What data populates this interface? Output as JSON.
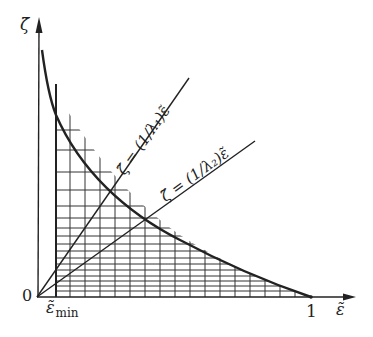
{
  "figure": {
    "axes": {
      "y_label": "ζ̃",
      "x_label": "ε̃",
      "origin_label": "0",
      "x_tick_one": "1",
      "x_tick_min_base": "ε̃",
      "x_tick_min_sub": "min"
    },
    "lines": [
      {
        "id": "line-lambda1",
        "label": "ζ̃ = (1/λ₁)ε̃"
      },
      {
        "id": "line-lambda2",
        "label": "ζ̃ = (1/λ₂)ε̃"
      }
    ],
    "colors": {
      "ink": "#222222",
      "background": "#ffffff"
    }
  }
}
